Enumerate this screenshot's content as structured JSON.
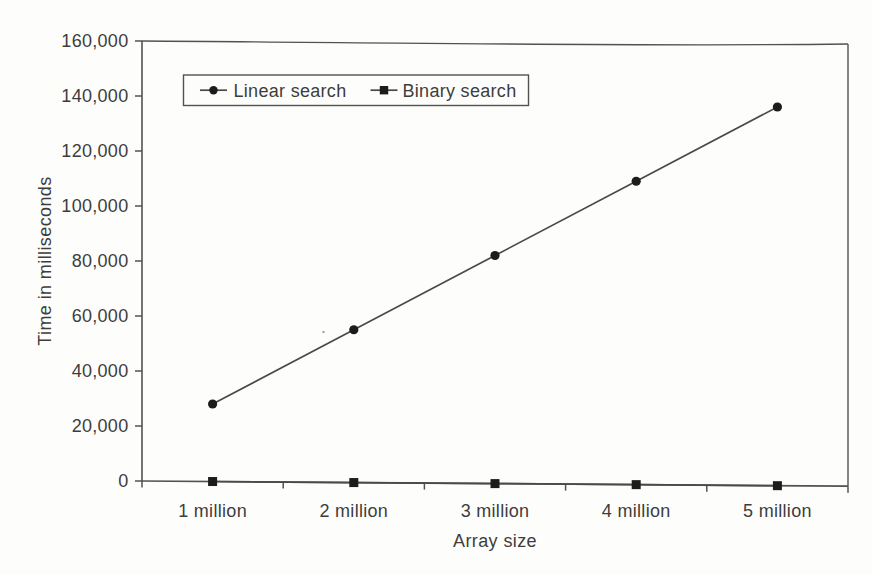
{
  "chart_data": {
    "type": "line",
    "title": "",
    "xlabel": "Array size",
    "ylabel": "Time in milliseconds",
    "categories": [
      "1 million",
      "2 million",
      "3 million",
      "4 million",
      "5 million"
    ],
    "series": [
      {
        "name": "Linear search",
        "marker": "circle",
        "values": [
          28000,
          55000,
          82000,
          109000,
          136000
        ]
      },
      {
        "name": "Binary search",
        "marker": "square",
        "values": [
          0,
          0,
          0,
          0,
          0
        ]
      }
    ],
    "ylim": [
      0,
      160000
    ],
    "ytick_step": 20000,
    "ytick_labels": [
      "0",
      "20,000",
      "40,000",
      "60,000",
      "80,000",
      "100,000",
      "120,000",
      "140,000",
      "160,000"
    ],
    "grid": false,
    "legend_position": "top-left-inside",
    "colors": {
      "line": "#4a4a4a",
      "marker": "#1c1c1c",
      "frame": "#525252",
      "text": "#3d3d3d",
      "background": "#fdfdfc"
    }
  }
}
